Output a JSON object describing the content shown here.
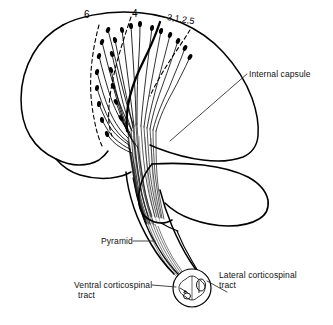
{
  "figure": {
    "background_color": "#ffffff",
    "line_color": "#000000",
    "width": 333,
    "height": 325
  },
  "cortical_areas": {
    "premotor_label": "6",
    "motor_label": "4",
    "sensory_label": "3,1,2,5"
  },
  "labels": {
    "internal_capsule": "Internal capsule",
    "pyramid": "Pyramid",
    "ventral_tract_line1": "Ventral corticospinal",
    "ventral_tract_line2": "tract",
    "lateral_tract_line1": "Lateral corticospinal",
    "lateral_tract_line2": "tract"
  }
}
